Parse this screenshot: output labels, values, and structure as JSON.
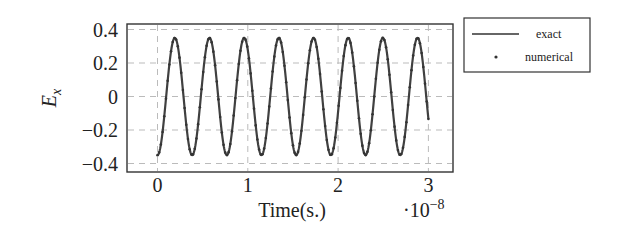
{
  "chart_data": {
    "type": "line",
    "title": "",
    "xlabel": "Time(s.)",
    "x_scale_label": "·10^-8",
    "x_scale_base": "10",
    "x_scale_exp": "−8",
    "ylabel": "E_x",
    "ylabel_main": "E",
    "ylabel_sub": "x",
    "xlim": [
      -0.3,
      3.27
    ],
    "ylim": [
      -0.42,
      0.42
    ],
    "x_ticks": [
      0,
      1,
      2,
      3
    ],
    "x_tick_labels": [
      "0",
      "1",
      "2",
      "3"
    ],
    "y_ticks": [
      0.4,
      0.2,
      0,
      -0.2,
      -0.4
    ],
    "y_tick_labels": [
      "0.4",
      "0.2",
      "0",
      "−0.2",
      "−0.4"
    ],
    "grid": true,
    "grid_style": "dashed",
    "legend_position": "outside-right-top",
    "legend": [
      "exact",
      "numerical"
    ],
    "series": [
      {
        "name": "exact",
        "style": "solid-line",
        "amplitude": 0.35,
        "period_e8": 0.384,
        "form": "-A*cos(2*pi*t/T)",
        "t_range_e8": [
          0,
          3
        ]
      },
      {
        "name": "numerical",
        "style": "dots",
        "amplitude": 0.35,
        "period_e8": 0.384,
        "form": "-A*cos(2*pi*t/T)",
        "t_range_e8": [
          0,
          3
        ]
      }
    ],
    "approx_peaks_x_e8": [
      0.19,
      0.57,
      0.96,
      1.34,
      1.73,
      2.11,
      2.49,
      2.88
    ],
    "approx_peak_value": 0.35,
    "approx_trough_value": -0.35,
    "start_value": -0.35,
    "end_value_approx": -0.06
  }
}
